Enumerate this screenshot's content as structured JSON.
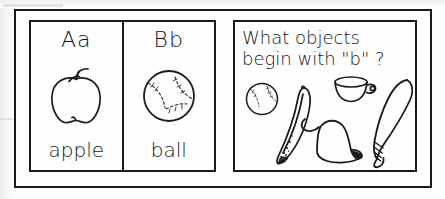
{
  "worksheet": {
    "letter_cards": [
      {
        "letter_pair": "Aa",
        "word": "apple",
        "icon": "apple-illustration"
      },
      {
        "letter_pair": "Bb",
        "word": "ball",
        "icon": "baseball-illustration"
      }
    ],
    "question": {
      "line1": "What objects",
      "line2": "begin with \"b\" ?"
    },
    "objects": [
      {
        "name": "baseball-illustration",
        "label": "baseball"
      },
      {
        "name": "banana-illustration",
        "label": "banana"
      },
      {
        "name": "cup-illustration",
        "label": "cup"
      },
      {
        "name": "bell-illustration",
        "label": "bell"
      },
      {
        "name": "baseball-bat-illustration",
        "label": "baseball bat"
      }
    ],
    "colors": {
      "ink": "#1a1a1a",
      "paper": "#ffffff"
    }
  }
}
